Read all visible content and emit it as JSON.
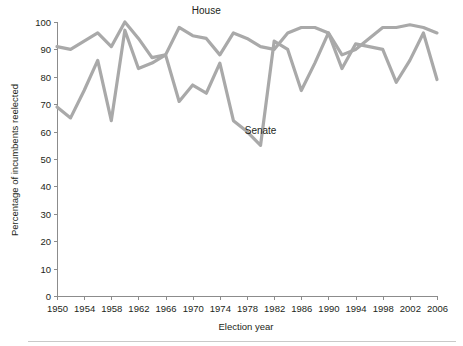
{
  "chart_data": {
    "type": "line",
    "title": "",
    "xlabel": "Election year",
    "ylabel": "Percentage of incumbents reelected",
    "xlim": [
      1950,
      2006
    ],
    "ylim": [
      0,
      100
    ],
    "grid": false,
    "legend_position": "inline-annotation",
    "x_tick_labels": [
      "1950",
      "1954",
      "1958",
      "1962",
      "1966",
      "1970",
      "1974",
      "1978",
      "1982",
      "1986",
      "1990",
      "1994",
      "1998",
      "2002",
      "2006"
    ],
    "x_tick_values": [
      1950,
      1954,
      1958,
      1962,
      1966,
      1970,
      1974,
      1978,
      1982,
      1986,
      1990,
      1994,
      1998,
      2002,
      2006
    ],
    "y_tick_labels": [
      "0",
      "10",
      "20",
      "30",
      "40",
      "50",
      "60",
      "70",
      "80",
      "90",
      "100"
    ],
    "y_tick_values": [
      0,
      10,
      20,
      30,
      40,
      50,
      60,
      70,
      80,
      90,
      100
    ],
    "x": [
      1950,
      1952,
      1954,
      1956,
      1958,
      1960,
      1962,
      1964,
      1966,
      1968,
      1970,
      1972,
      1974,
      1976,
      1978,
      1980,
      1982,
      1984,
      1986,
      1988,
      1990,
      1992,
      1994,
      1996,
      1998,
      2000,
      2002,
      2004,
      2006
    ],
    "series": [
      {
        "name": "House",
        "color": "#a9a9a9",
        "values": [
          91,
          90,
          93,
          96,
          91,
          100,
          94,
          87,
          88,
          98,
          95,
          94,
          88,
          96,
          94,
          91,
          90,
          96,
          98,
          98,
          96,
          88,
          90,
          94,
          98,
          98,
          99,
          98,
          96
        ],
        "label_x": 1972,
        "label_y": 103
      },
      {
        "name": "Senate",
        "color": "#a9a9a9",
        "values": [
          69,
          65,
          75,
          86,
          64,
          97,
          83,
          85,
          88,
          71,
          77,
          74,
          85,
          64,
          60,
          55,
          93,
          90,
          75,
          85,
          96,
          83,
          92,
          91,
          90,
          78,
          86,
          96,
          79
        ],
        "label_x": 1980,
        "label_y": 59
      }
    ]
  },
  "axis": {
    "x_title": "Election year",
    "y_title": "Percentage of incumbents reelected"
  }
}
